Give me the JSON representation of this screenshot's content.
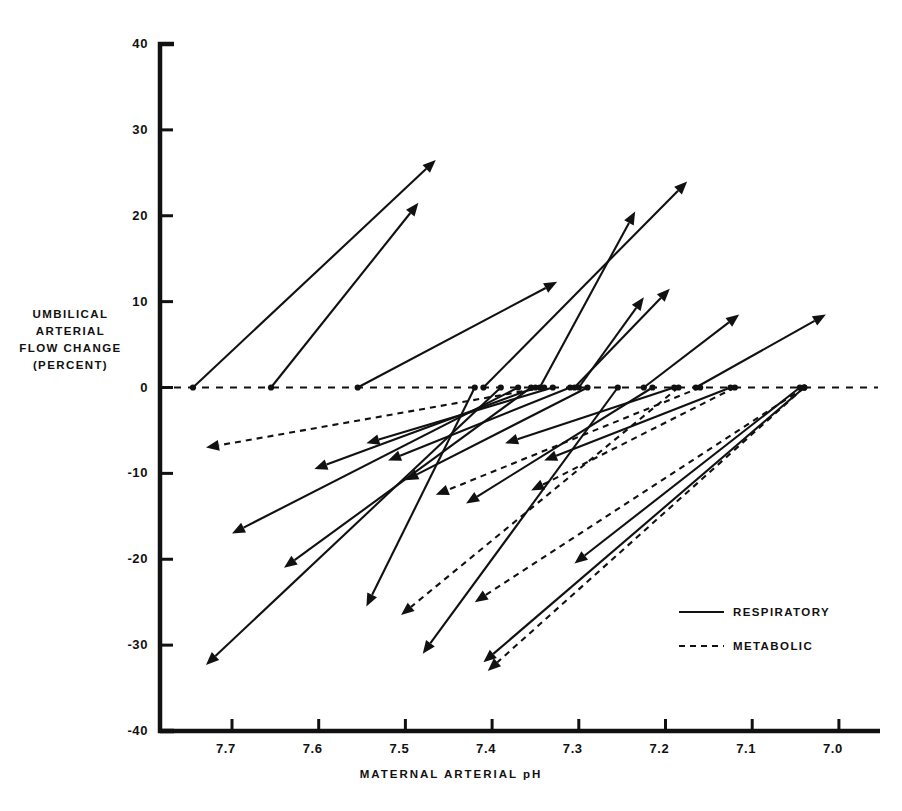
{
  "chart_data": {
    "type": "scatter",
    "title": "",
    "xlabel": "MATERNAL ARTERIAL pH",
    "ylabel": "UMBILICAL ARTERIAL FLOW CHANGE (PERCENT)",
    "ylabel_lines": [
      "UMBILICAL",
      "ARTERIAL",
      "FLOW  CHANGE",
      "(PERCENT)"
    ],
    "xlim": [
      7.76,
      6.96
    ],
    "ylim": [
      -40,
      40
    ],
    "x_inverted": true,
    "grid": false,
    "xticks": [
      "7.7",
      "7.6",
      "7.5",
      "7.4",
      "7.3",
      "7.2",
      "7.1",
      "7.0"
    ],
    "xtick_values": [
      7.7,
      7.6,
      7.5,
      7.4,
      7.3,
      7.2,
      7.1,
      7.0
    ],
    "yticks": [
      "40",
      "30",
      "20",
      "10",
      "0",
      "-10",
      "-20",
      "-30",
      "-40"
    ],
    "ytick_values": [
      40,
      30,
      20,
      10,
      0,
      -10,
      -20,
      -30,
      -40
    ],
    "zero_reference_line": {
      "y": 0,
      "style": "dashed",
      "label": ""
    },
    "legend": {
      "position": "inside-right",
      "entries": [
        {
          "label": "RESPIRATORY",
          "style": "solid"
        },
        {
          "label": "METABOLIC",
          "style": "dashed"
        }
      ]
    },
    "arrow_note": "each arrow runs from a control point on the 0% line (tail) to the measured point (head); x = maternal arterial pH, y = umbilical arterial flow change in percent",
    "series": [
      {
        "name": "RESPIRATORY",
        "style": "solid",
        "arrows": [
          {
            "x0": 7.745,
            "y0": 0,
            "x1": 7.465,
            "y1": 26.5
          },
          {
            "x0": 7.655,
            "y0": 0,
            "x1": 7.485,
            "y1": 21.5
          },
          {
            "x0": 7.555,
            "y0": 0,
            "x1": 7.325,
            "y1": 12.3
          },
          {
            "x0": 7.41,
            "y0": 0,
            "x1": 7.175,
            "y1": 24.0
          },
          {
            "x0": 7.345,
            "y0": 0,
            "x1": 7.235,
            "y1": 20.5
          },
          {
            "x0": 7.305,
            "y0": 0,
            "x1": 7.195,
            "y1": 11.5
          },
          {
            "x0": 7.3,
            "y0": 0,
            "x1": 7.225,
            "y1": 10.5
          },
          {
            "x0": 7.225,
            "y0": 0,
            "x1": 7.115,
            "y1": 8.5
          },
          {
            "x0": 7.165,
            "y0": 0,
            "x1": 7.015,
            "y1": 8.5
          },
          {
            "x0": 7.39,
            "y0": 0,
            "x1": 7.73,
            "y1": -32.3
          },
          {
            "x0": 7.37,
            "y0": 0,
            "x1": 7.7,
            "y1": -17.0
          },
          {
            "x0": 7.355,
            "y0": 0,
            "x1": 7.64,
            "y1": -21.0
          },
          {
            "x0": 7.35,
            "y0": 0,
            "x1": 7.605,
            "y1": -9.5
          },
          {
            "x0": 7.33,
            "y0": 0,
            "x1": 7.545,
            "y1": -6.5
          },
          {
            "x0": 7.42,
            "y0": 0,
            "x1": 7.545,
            "y1": -25.5
          },
          {
            "x0": 7.31,
            "y0": 0,
            "x1": 7.52,
            "y1": -8.5
          },
          {
            "x0": 7.29,
            "y0": 0,
            "x1": 7.5,
            "y1": -10.8
          },
          {
            "x0": 7.255,
            "y0": 0,
            "x1": 7.48,
            "y1": -31.0
          },
          {
            "x0": 7.215,
            "y0": 0,
            "x1": 7.43,
            "y1": -13.5
          },
          {
            "x0": 7.19,
            "y0": 0,
            "x1": 7.385,
            "y1": -6.5
          },
          {
            "x0": 7.125,
            "y0": 0,
            "x1": 7.34,
            "y1": -8.5
          },
          {
            "x0": 7.045,
            "y0": 0,
            "x1": 7.305,
            "y1": -20.5
          },
          {
            "x0": 7.04,
            "y0": 0,
            "x1": 7.41,
            "y1": -32.0
          }
        ]
      },
      {
        "name": "METABOLIC",
        "style": "dashed",
        "arrows": [
          {
            "x0": 7.34,
            "y0": 0,
            "x1": 7.73,
            "y1": -7.0
          },
          {
            "x0": 7.185,
            "y0": 0,
            "x1": 7.505,
            "y1": -26.5
          },
          {
            "x0": 7.16,
            "y0": 0,
            "x1": 7.465,
            "y1": -12.5
          },
          {
            "x0": 7.12,
            "y0": 0,
            "x1": 7.355,
            "y1": -12.0
          },
          {
            "x0": 7.04,
            "y0": 0,
            "x1": 7.42,
            "y1": -25.0
          },
          {
            "x0": 7.04,
            "y0": 0,
            "x1": 7.405,
            "y1": -33.0
          }
        ]
      }
    ]
  },
  "axes": {
    "y_title_lines": [
      "UMBILICAL",
      "ARTERIAL",
      "FLOW  CHANGE",
      "(PERCENT)"
    ],
    "x_title": "MATERNAL ARTERIAL pH"
  },
  "legend": {
    "respiratory_label": "RESPIRATORY",
    "metabolic_label": "METABOLIC"
  },
  "colors": {
    "ink": "#111111",
    "background": "#ffffff"
  }
}
